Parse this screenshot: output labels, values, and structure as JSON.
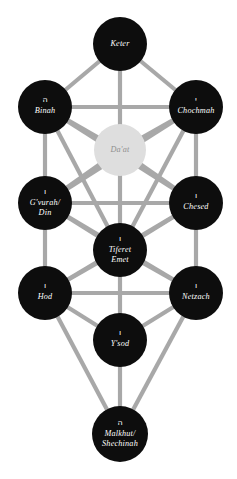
{
  "diagram": {
    "background_color": "#ffffff",
    "edge_color": "#a8a8a8",
    "node_dark_color": "#0d0d0d",
    "node_light_color": "#dedede",
    "node_text_color": "#ffffff",
    "daat_text_color": "#8f8f8f"
  },
  "nodes": [
    {
      "id": "keter",
      "label_line1": "Keter",
      "label_line2": "",
      "hebrew": "",
      "cx": 120,
      "cy": 44,
      "r": 27,
      "style": "dark"
    },
    {
      "id": "binah",
      "label_line1": "Binah",
      "label_line2": "",
      "hebrew": "ה",
      "cx": 45,
      "cy": 107,
      "r": 27,
      "style": "dark"
    },
    {
      "id": "chochmah",
      "label_line1": "Chochmah",
      "label_line2": "",
      "hebrew": "י",
      "cx": 196,
      "cy": 107,
      "r": 27,
      "style": "dark"
    },
    {
      "id": "daat",
      "label_line1": "Da'at",
      "label_line2": "",
      "hebrew": "",
      "cx": 120,
      "cy": 150,
      "r": 26,
      "style": "light"
    },
    {
      "id": "gvurah-din",
      "label_line1": "G'vurah/",
      "label_line2": "Din",
      "hebrew": "ו",
      "cx": 45,
      "cy": 203,
      "r": 27,
      "style": "dark"
    },
    {
      "id": "chesed",
      "label_line1": "Chesed",
      "label_line2": "",
      "hebrew": "ו",
      "cx": 196,
      "cy": 203,
      "r": 27,
      "style": "dark"
    },
    {
      "id": "tiferet-emet",
      "label_line1": "Tiferet",
      "label_line2": "Emet",
      "hebrew": "ו",
      "cx": 120,
      "cy": 250,
      "r": 27,
      "style": "dark"
    },
    {
      "id": "hod",
      "label_line1": "Hod",
      "label_line2": "",
      "hebrew": "ו",
      "cx": 45,
      "cy": 293,
      "r": 27,
      "style": "dark"
    },
    {
      "id": "netzach",
      "label_line1": "Netzach",
      "label_line2": "",
      "hebrew": "ו",
      "cx": 196,
      "cy": 293,
      "r": 27,
      "style": "dark"
    },
    {
      "id": "ysod",
      "label_line1": "Y'sod",
      "label_line2": "",
      "hebrew": "ו",
      "cx": 120,
      "cy": 340,
      "r": 27,
      "style": "dark"
    },
    {
      "id": "malkhut-shechinah",
      "label_line1": "Malkhut/",
      "label_line2": "Shechinah",
      "hebrew": "ה",
      "cx": 120,
      "cy": 434,
      "r": 28,
      "style": "dark"
    }
  ],
  "edges": [
    {
      "from": "keter",
      "to": "binah"
    },
    {
      "from": "keter",
      "to": "chochmah"
    },
    {
      "from": "keter",
      "to": "daat"
    },
    {
      "from": "binah",
      "to": "chochmah"
    },
    {
      "from": "binah",
      "to": "daat"
    },
    {
      "from": "chochmah",
      "to": "daat"
    },
    {
      "from": "binah",
      "to": "gvurah-din"
    },
    {
      "from": "chochmah",
      "to": "chesed"
    },
    {
      "from": "binah",
      "to": "chesed"
    },
    {
      "from": "chochmah",
      "to": "gvurah-din"
    },
    {
      "from": "binah",
      "to": "tiferet-emet"
    },
    {
      "from": "chochmah",
      "to": "tiferet-emet"
    },
    {
      "from": "daat",
      "to": "gvurah-din"
    },
    {
      "from": "daat",
      "to": "chesed"
    },
    {
      "from": "daat",
      "to": "tiferet-emet"
    },
    {
      "from": "gvurah-din",
      "to": "chesed"
    },
    {
      "from": "gvurah-din",
      "to": "tiferet-emet"
    },
    {
      "from": "chesed",
      "to": "tiferet-emet"
    },
    {
      "from": "gvurah-din",
      "to": "hod"
    },
    {
      "from": "chesed",
      "to": "netzach"
    },
    {
      "from": "gvurah-din",
      "to": "netzach"
    },
    {
      "from": "chesed",
      "to": "hod"
    },
    {
      "from": "tiferet-emet",
      "to": "hod"
    },
    {
      "from": "tiferet-emet",
      "to": "netzach"
    },
    {
      "from": "tiferet-emet",
      "to": "ysod"
    },
    {
      "from": "hod",
      "to": "netzach"
    },
    {
      "from": "hod",
      "to": "ysod"
    },
    {
      "from": "netzach",
      "to": "ysod"
    },
    {
      "from": "hod",
      "to": "malkhut-shechinah"
    },
    {
      "from": "netzach",
      "to": "malkhut-shechinah"
    },
    {
      "from": "ysod",
      "to": "malkhut-shechinah"
    }
  ]
}
